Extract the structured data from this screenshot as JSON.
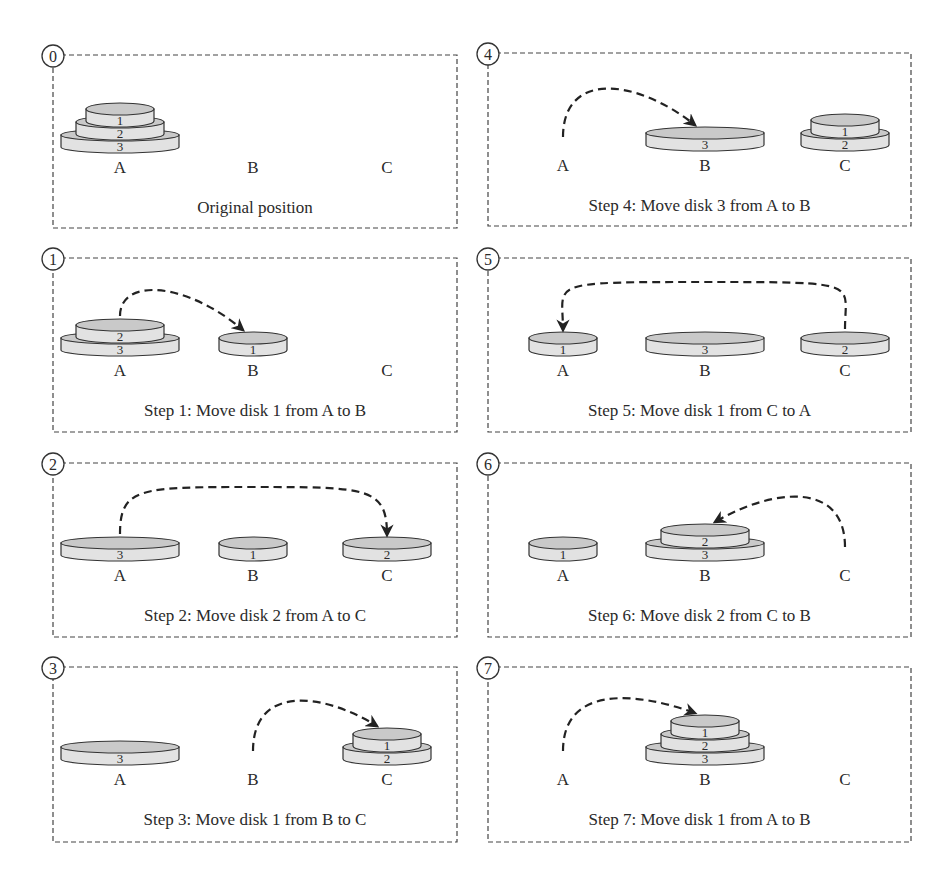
{
  "pegs": [
    "A",
    "B",
    "C"
  ],
  "colors": {
    "stroke": "#333333",
    "disk_top": "#c9c9c9",
    "disk_side": "#e2e2e2",
    "text": "#2a2a2a"
  },
  "panels": [
    {
      "id": "0",
      "step": 0,
      "caption": "Original position",
      "layout": [
        [
          3,
          2,
          1
        ],
        [],
        []
      ],
      "move": null
    },
    {
      "id": "1",
      "step": 1,
      "caption": "Step 1: Move disk 1 from A to B",
      "layout": [
        [
          3,
          2
        ],
        [
          1
        ],
        []
      ],
      "move": {
        "disk": 1,
        "from": "A",
        "to": "B"
      }
    },
    {
      "id": "2",
      "step": 2,
      "caption": "Step 2: Move disk 2 from A to C",
      "layout": [
        [
          3
        ],
        [
          1
        ],
        [
          2
        ]
      ],
      "move": {
        "disk": 2,
        "from": "A",
        "to": "C"
      }
    },
    {
      "id": "3",
      "step": 3,
      "caption": "Step 3: Move disk 1 from B to C",
      "layout": [
        [
          3
        ],
        [],
        [
          2,
          1
        ]
      ],
      "move": {
        "disk": 1,
        "from": "B",
        "to": "C"
      }
    },
    {
      "id": "4",
      "step": 4,
      "caption": "Step 4: Move disk 3 from A to B",
      "layout": [
        [],
        [
          3
        ],
        [
          2,
          1
        ]
      ],
      "move": {
        "disk": 3,
        "from": "A",
        "to": "B"
      }
    },
    {
      "id": "5",
      "step": 5,
      "caption": "Step 5: Move disk 1 from C to A",
      "layout": [
        [
          1
        ],
        [
          3
        ],
        [
          2
        ]
      ],
      "move": {
        "disk": 1,
        "from": "C",
        "to": "A"
      }
    },
    {
      "id": "6",
      "step": 6,
      "caption": "Step 6: Move disk 2 from C to B",
      "layout": [
        [
          1
        ],
        [
          3,
          2
        ],
        []
      ],
      "move": {
        "disk": 2,
        "from": "C",
        "to": "B"
      }
    },
    {
      "id": "7",
      "step": 7,
      "caption": "Step 7: Move disk 1 from A to B",
      "layout": [
        [],
        [
          3,
          2,
          1
        ],
        []
      ],
      "move": {
        "disk": 1,
        "from": "A",
        "to": "B"
      }
    }
  ]
}
